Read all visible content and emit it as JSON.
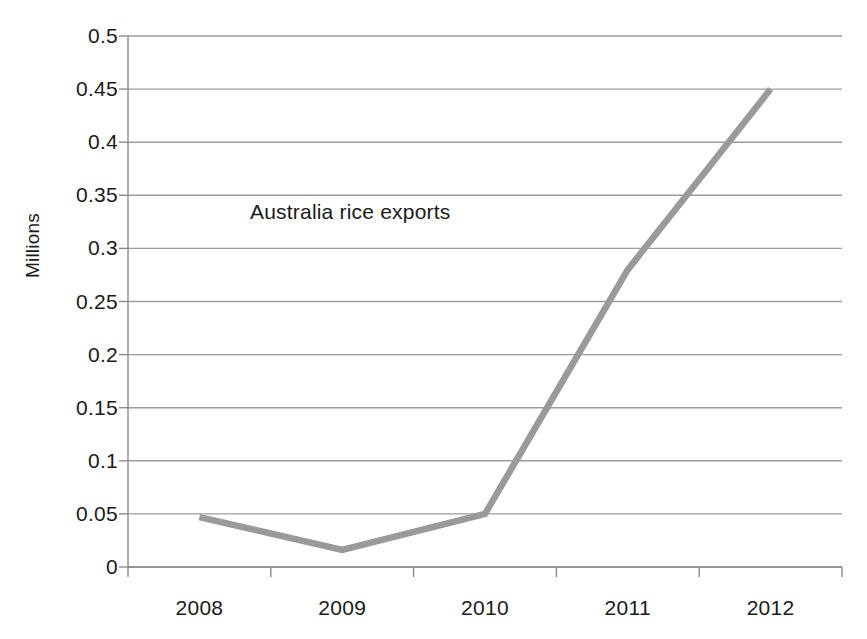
{
  "chart_data": {
    "type": "line",
    "title": "",
    "annotation": "Australia rice exports",
    "xlabel": "",
    "ylabel": "Millions",
    "categories": [
      "2008",
      "2009",
      "2010",
      "2011",
      "2012"
    ],
    "series": [
      {
        "name": "Australia rice exports",
        "values": [
          0.047,
          0.016,
          0.05,
          0.28,
          0.45
        ],
        "color": "#9a9a9a"
      }
    ],
    "ylim": [
      0,
      0.5
    ],
    "y_ticks": [
      "0",
      "0.05",
      "0.1",
      "0.15",
      "0.2",
      "0.25",
      "0.3",
      "0.35",
      "0.4",
      "0.45",
      "0.5"
    ],
    "y_tick_values": [
      0,
      0.05,
      0.1,
      0.15,
      0.2,
      0.25,
      0.3,
      0.35,
      0.4,
      0.45,
      0.5
    ],
    "grid": "horizontal",
    "legend": "none",
    "axis_color": "#7f7f7f",
    "gridline_color": "#9b9b9b",
    "series_color": "#9a9a9a",
    "background": "#ffffff"
  }
}
